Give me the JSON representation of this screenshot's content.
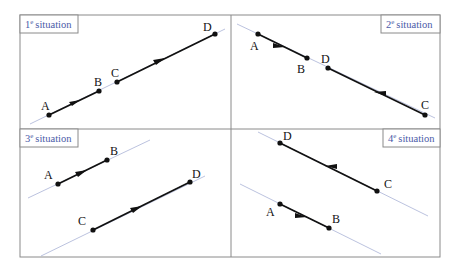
{
  "figure": {
    "panels": [
      {
        "id": "p1",
        "tag_num": "1",
        "tag_sup": "e",
        "tag_word": "situation",
        "points": {
          "A": "A",
          "B": "B",
          "C": "C",
          "D": "D"
        }
      },
      {
        "id": "p2",
        "tag_num": "2",
        "tag_sup": "e",
        "tag_word": "situation",
        "points": {
          "A": "A",
          "B": "B",
          "C": "C",
          "D": "D"
        }
      },
      {
        "id": "p3",
        "tag_num": "3",
        "tag_sup": "e",
        "tag_word": "situation",
        "points": {
          "A": "A",
          "B": "B",
          "C": "C",
          "D": "D"
        }
      },
      {
        "id": "p4",
        "tag_num": "4",
        "tag_sup": "e",
        "tag_word": "situation",
        "points": {
          "A": "A",
          "B": "B",
          "C": "C",
          "D": "D"
        }
      }
    ],
    "colors": {
      "frame": "#8a8a8a",
      "support_line": "#a9b3d6",
      "segment": "#111111",
      "tag_text": "#4a5aa8"
    }
  }
}
